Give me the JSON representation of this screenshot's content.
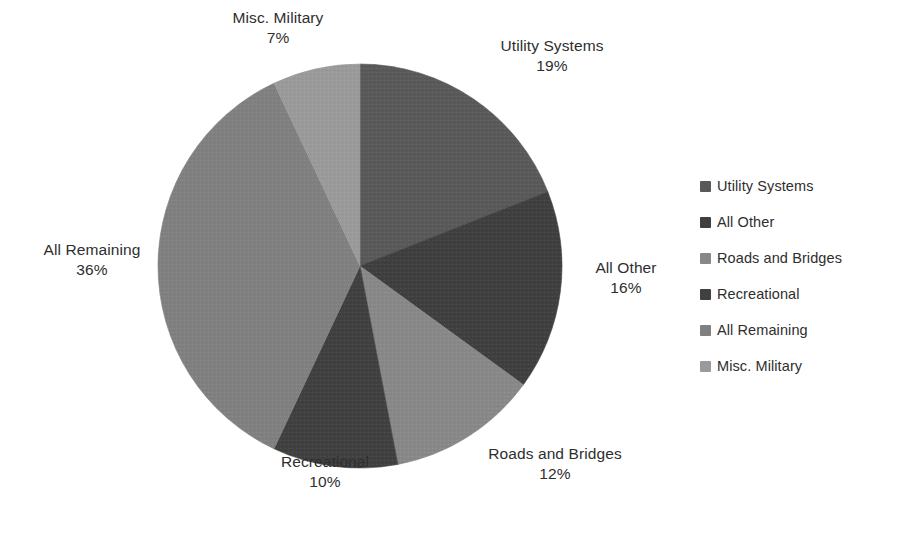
{
  "chart_data": {
    "type": "pie",
    "title": "",
    "categories": [
      "Utility Systems",
      "All Other",
      "Roads and Bridges",
      "Recreational",
      "All Remaining",
      "Misc. Military"
    ],
    "values": [
      19,
      16,
      12,
      10,
      36,
      7
    ],
    "value_unit": "%",
    "data_labels": [
      "19%",
      "16%",
      "12%",
      "10%",
      "36%",
      "7%"
    ],
    "start_angle_deg": 0,
    "direction": "clockwise",
    "legend_position": "right",
    "grid": false,
    "colors": [
      "#595959",
      "#3f3f3f",
      "#888888",
      "#404040",
      "#808080",
      "#9a9a9a"
    ]
  },
  "pie": {
    "slices": [
      {
        "name": "Utility Systems",
        "percent": 19,
        "label": "Utility Systems",
        "pct_text": "19%",
        "color": "#595959"
      },
      {
        "name": "All Other",
        "percent": 16,
        "label": "All Other",
        "pct_text": "16%",
        "color": "#3f3f3f"
      },
      {
        "name": "Roads and Bridges",
        "percent": 12,
        "label": "Roads and Bridges",
        "pct_text": "12%",
        "color": "#888888"
      },
      {
        "name": "Recreational",
        "percent": 10,
        "label": "Recreational",
        "pct_text": "10%",
        "color": "#404040"
      },
      {
        "name": "All Remaining",
        "percent": 36,
        "label": "All Remaining",
        "pct_text": "36%",
        "color": "#808080"
      },
      {
        "name": "Misc. Military",
        "percent": 7,
        "label": "Misc. Military",
        "pct_text": "7%",
        "color": "#9a9a9a"
      }
    ]
  },
  "legend": {
    "items": [
      {
        "label": "Utility Systems",
        "color": "#595959",
        "swatch_icon": "square-swatch-icon"
      },
      {
        "label": "All Other",
        "color": "#3f3f3f",
        "swatch_icon": "square-swatch-icon"
      },
      {
        "label": "Roads and Bridges",
        "color": "#888888",
        "swatch_icon": "square-swatch-icon"
      },
      {
        "label": "Recreational",
        "color": "#404040",
        "swatch_icon": "square-swatch-icon"
      },
      {
        "label": "All Remaining",
        "color": "#808080",
        "swatch_icon": "square-swatch-icon"
      },
      {
        "label": "Misc. Military",
        "color": "#9a9a9a",
        "swatch_icon": "square-swatch-icon"
      }
    ]
  }
}
